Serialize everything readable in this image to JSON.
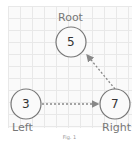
{
  "diagram": {
    "nodes": [
      {
        "id": "root",
        "value": "5",
        "label": "Root"
      },
      {
        "id": "left",
        "value": "3",
        "label": "Left"
      },
      {
        "id": "right",
        "value": "7",
        "label": "Right"
      }
    ],
    "edges": [
      {
        "from": "left",
        "to": "right",
        "style": "dashed-arrow"
      },
      {
        "from": "right",
        "to": "root",
        "style": "dashed-arrow"
      }
    ],
    "caption": "Fig. 1"
  },
  "colors": {
    "node_stroke": "#777777",
    "edge": "#888888",
    "grid": "#e8e8e8"
  }
}
